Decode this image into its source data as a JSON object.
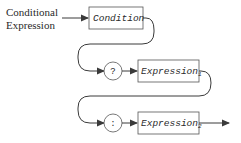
{
  "diagram": {
    "title_line1": "Conditional",
    "title_line2": "Expression",
    "nodes": [
      {
        "id": "condition",
        "shape": "box",
        "label": "Condition",
        "subscript": ""
      },
      {
        "id": "question",
        "shape": "circle",
        "label": "?"
      },
      {
        "id": "expression1",
        "shape": "box",
        "label": "Expression",
        "subscript": "1"
      },
      {
        "id": "colon",
        "shape": "circle",
        "label": ":"
      },
      {
        "id": "expression2",
        "shape": "box",
        "label": "Expression",
        "subscript": "2"
      }
    ],
    "colors": {
      "line": "#3a3a3a",
      "box_border": "#555555",
      "text": "#2a2a2a"
    }
  }
}
